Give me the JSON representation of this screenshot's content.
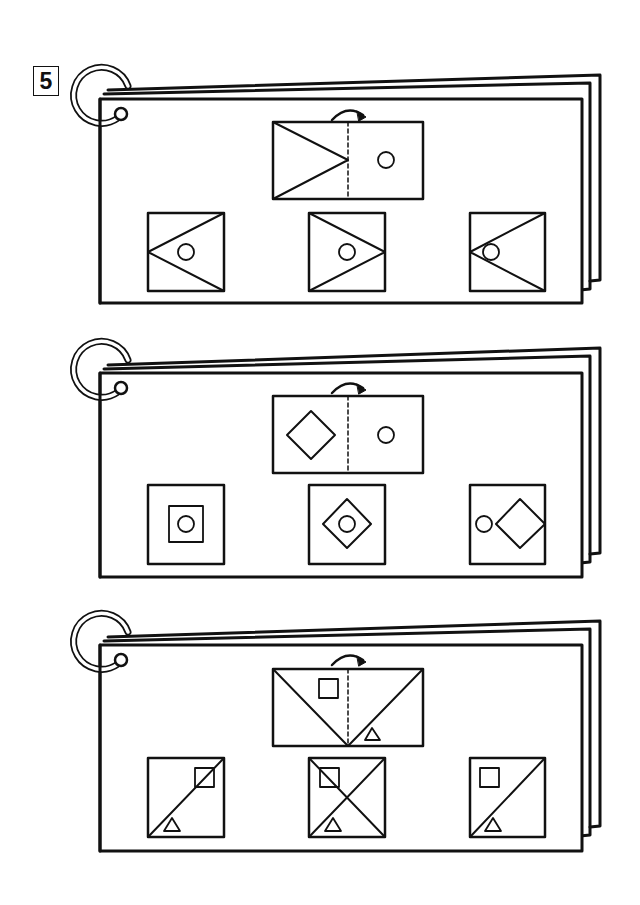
{
  "problem": {
    "number": "5",
    "instruction_icon": "fold-arrow-icon"
  },
  "colors": {
    "ink": "#111111",
    "paper": "#ffffff"
  },
  "cards": [
    {
      "id": "card-1",
      "question": {
        "fold": "fold-left-half-onto-right-along-dashed-line",
        "left_half": "triangle-pointing-right-from-left-edge-to-center-line",
        "right_half": "small-circle"
      },
      "options": [
        {
          "index": 1,
          "description": "square with triangle pointing left (apex at left edge), circle inside"
        },
        {
          "index": 2,
          "description": "square with triangle pointing right (apex at right edge), circle inside"
        },
        {
          "index": 3,
          "description": "square with triangle pointing left, circle at apex near left"
        }
      ]
    },
    {
      "id": "card-2",
      "question": {
        "fold": "fold-left-half-onto-right-along-dashed-line",
        "left_half": "diamond",
        "right_half": "small-circle"
      },
      "options": [
        {
          "index": 1,
          "description": "square with inner square, circle in center"
        },
        {
          "index": 2,
          "description": "square with diamond, circle in center"
        },
        {
          "index": 3,
          "description": "square with circle at left and diamond at right"
        }
      ]
    },
    {
      "id": "card-3",
      "question": {
        "fold": "fold-left-half-onto-right-along-dashed-line",
        "left_half": "diagonal from top-left to bottom-center, small square upper",
        "right_half": "diagonal from bottom-center to top-right, small triangle lower"
      },
      "options": [
        {
          "index": 1,
          "description": "square with diagonal bottom-left to top-right, small square on diagonal top-right, triangle bottom-left"
        },
        {
          "index": 2,
          "description": "square with both diagonals (X), small square top-left, triangle bottom-center"
        },
        {
          "index": 3,
          "description": "square with diagonal bottom-left to top-right, small square top-left, triangle bottom-center"
        }
      ]
    }
  ]
}
